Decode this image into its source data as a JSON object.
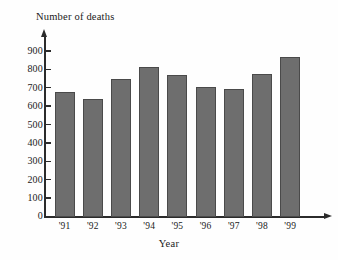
{
  "chart_data": {
    "type": "bar",
    "title": "",
    "categories": [
      "'91",
      "'92",
      "'93",
      "'94",
      "'95",
      "'96",
      "'97",
      "'98",
      "'99"
    ],
    "values": [
      680,
      640,
      750,
      815,
      775,
      710,
      695,
      780,
      870
    ],
    "xlabel": "Year",
    "ylabel": "Number of deaths",
    "ylim": [
      0,
      900
    ],
    "ytick_labels": [
      "900",
      "800",
      "700",
      "600",
      "500",
      "400",
      "300",
      "200",
      "100",
      "0"
    ],
    "ytick_values": [
      900,
      800,
      700,
      600,
      500,
      400,
      300,
      200,
      100,
      0
    ],
    "ytick_step": 100,
    "grid": false,
    "legend": false,
    "bar_color": "#6e6e6e",
    "bar_edge_color": "#4a4a4a",
    "axis_color": "#2b2b2b",
    "background_color": "#fefefe"
  },
  "axes": {
    "y_title": "Number of deaths",
    "x_title": "Year"
  }
}
